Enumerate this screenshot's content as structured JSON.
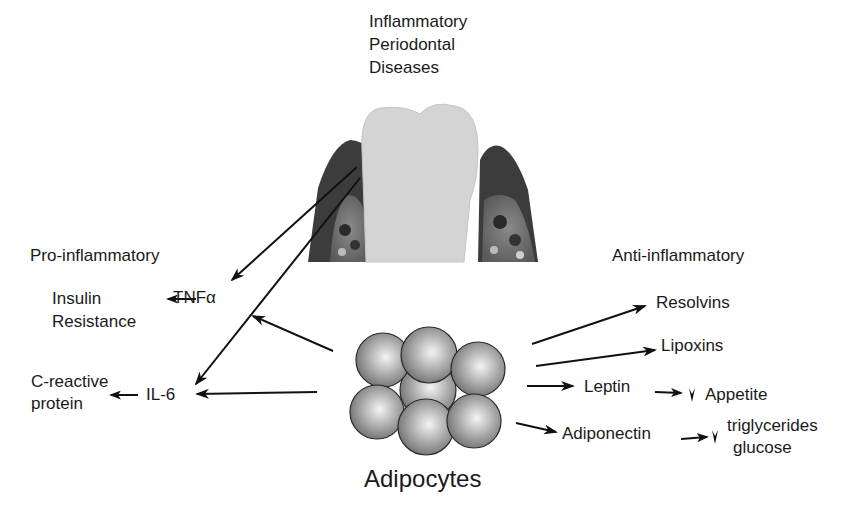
{
  "diagram": {
    "title": [
      "Inflammatory",
      "Periodontal",
      "Diseases"
    ],
    "center_label": "Adipocytes",
    "pro_inflammatory": {
      "heading": "Pro-inflammatory",
      "mediators": [
        {
          "name": "TNFα",
          "effect": [
            "Insulin",
            "Resistance"
          ]
        },
        {
          "name": "IL-6",
          "effect": [
            "C-reactive",
            "protein"
          ]
        }
      ]
    },
    "anti_inflammatory": {
      "heading": "Anti-inflammatory",
      "mediators": [
        {
          "name": "Resolvins"
        },
        {
          "name": "Lipoxins"
        },
        {
          "name": "Leptin",
          "effect": [
            "Appetite"
          ],
          "direction": "decrease"
        },
        {
          "name": "Adiponectin",
          "effect": [
            "triglycerides",
            "glucose"
          ],
          "direction": "decrease"
        }
      ]
    },
    "colors": {
      "gum": "#3c3c3c",
      "tooth": "#d4d4d4",
      "bone": "#9a9a9a",
      "cell": "#8a8a8a",
      "arrow": "#111111"
    }
  }
}
